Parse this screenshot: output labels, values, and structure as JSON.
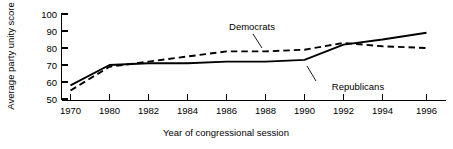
{
  "chart_data": {
    "type": "line",
    "title": "",
    "subtitle": "",
    "xlabel": "Year of congressional session",
    "ylabel": "Average party unity score",
    "categories": [
      "1970",
      "1980",
      "1982",
      "1984",
      "1986",
      "1988",
      "1990",
      "1992",
      "1994",
      "1996"
    ],
    "x_tick_labels": [
      "1970",
      "1980",
      "1982",
      "1984",
      "1986",
      "1988",
      "1990",
      "1992",
      "1994",
      "1996"
    ],
    "y_tick_labels": [
      "50",
      "60",
      "70",
      "80",
      "90",
      "100"
    ],
    "y_ticks": [
      50,
      60,
      70,
      80,
      90,
      100
    ],
    "ylim": [
      50,
      100
    ],
    "grid": false,
    "legend_position": "inline-annotations",
    "note": "x axis categories are evenly spaced, not linear in time",
    "series": [
      {
        "name": "Democrats",
        "style": "dashed",
        "color": "#000000",
        "values": [
          55,
          69,
          72,
          75,
          78,
          78,
          79,
          83,
          81,
          80
        ]
      },
      {
        "name": "Republicans",
        "style": "solid",
        "color": "#000000",
        "values": [
          58,
          70,
          71,
          71,
          72,
          72,
          73,
          82,
          85,
          89
        ]
      }
    ],
    "annotations": [
      {
        "text": "Democrats",
        "series": "Democrats",
        "anchor_category": "1988"
      },
      {
        "text": "Republicans",
        "series": "Republicans",
        "anchor_category": "1992"
      }
    ]
  },
  "axes": {
    "y_axis_title": "Average party unity score",
    "x_axis_title": "Year of congressional session"
  }
}
